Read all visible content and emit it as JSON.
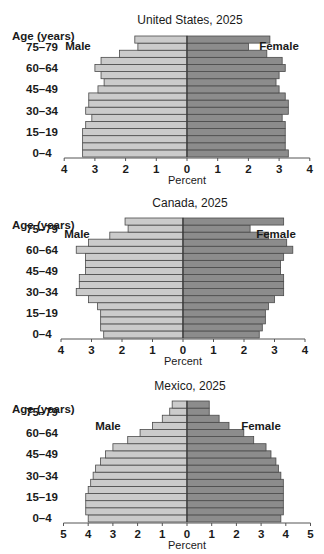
{
  "age_groups": [
    "0-4",
    "5-9",
    "10-14",
    "15-19",
    "20-24",
    "25-29",
    "30-34",
    "35-39",
    "40-44",
    "45-49",
    "50-54",
    "55-59",
    "60-64",
    "65-69",
    "70-74",
    "75-79",
    "80+"
  ],
  "age_labels_shown": [
    "0–4",
    "15–19",
    "30–34",
    "45–49",
    "60–64",
    "75–79"
  ],
  "axis_label_age": "Age (years)",
  "axis_label_x": "Percent",
  "legend": {
    "male": "Male",
    "female": "Female"
  },
  "colors": {
    "male": "#cbcbcb",
    "female": "#8c8c8c",
    "divider": "#4a4a4a",
    "axis": "#555555"
  },
  "chart_data": [
    {
      "type": "bar",
      "orientation": "horizontal-population-pyramid",
      "title": "United States, 2025",
      "xlabel": "Percent",
      "ylabel": "Age (years)",
      "xlim": [
        -4,
        4
      ],
      "xticks": [
        4,
        3,
        2,
        1,
        0,
        1,
        2,
        3,
        4
      ],
      "categories": [
        "0-4",
        "5-9",
        "10-14",
        "15-19",
        "20-24",
        "25-29",
        "30-34",
        "35-39",
        "40-44",
        "45-49",
        "50-54",
        "55-59",
        "60-64",
        "65-69",
        "70-74",
        "75-79",
        "80+"
      ],
      "series": [
        {
          "name": "Male",
          "values": [
            3.4,
            3.4,
            3.4,
            3.4,
            3.3,
            3.1,
            3.3,
            3.2,
            3.2,
            2.9,
            2.7,
            2.8,
            3.0,
            2.8,
            2.2,
            1.6,
            1.7
          ]
        },
        {
          "name": "Female",
          "values": [
            3.3,
            3.2,
            3.2,
            3.2,
            3.2,
            3.1,
            3.3,
            3.3,
            3.2,
            3.0,
            2.9,
            3.0,
            3.2,
            3.1,
            2.6,
            2.0,
            2.7
          ]
        }
      ],
      "legend_position": "inside-top"
    },
    {
      "type": "bar",
      "orientation": "horizontal-population-pyramid",
      "title": "Canada, 2025",
      "xlabel": "Percent",
      "ylabel": "Age (years)",
      "xlim": [
        -4,
        4
      ],
      "xticks": [
        4,
        3,
        2,
        1,
        0,
        1,
        2,
        3,
        4
      ],
      "categories": [
        "0-4",
        "5-9",
        "10-14",
        "15-19",
        "20-24",
        "25-29",
        "30-34",
        "35-39",
        "40-44",
        "45-49",
        "50-54",
        "55-59",
        "60-64",
        "65-69",
        "70-74",
        "75-79",
        "80+"
      ],
      "series": [
        {
          "name": "Male",
          "values": [
            2.6,
            2.7,
            2.7,
            2.7,
            2.8,
            3.1,
            3.5,
            3.4,
            3.4,
            3.2,
            3.2,
            3.2,
            3.5,
            3.1,
            2.4,
            1.8,
            1.9
          ]
        },
        {
          "name": "Female",
          "values": [
            2.5,
            2.6,
            2.7,
            2.7,
            2.8,
            3.0,
            3.3,
            3.3,
            3.3,
            3.2,
            3.2,
            3.3,
            3.6,
            3.4,
            2.8,
            2.2,
            3.3
          ]
        }
      ],
      "legend_position": "inside-top"
    },
    {
      "type": "bar",
      "orientation": "horizontal-population-pyramid",
      "title": "Mexico, 2025",
      "xlabel": "Percent",
      "ylabel": "Age (years)",
      "xlim": [
        -5,
        5
      ],
      "xticks": [
        5,
        4,
        3,
        2,
        1,
        0,
        1,
        2,
        3,
        4,
        5
      ],
      "categories": [
        "0-4",
        "5-9",
        "10-14",
        "15-19",
        "20-24",
        "25-29",
        "30-34",
        "35-39",
        "40-44",
        "45-49",
        "50-54",
        "55-59",
        "60-64",
        "65-69",
        "70-74",
        "75-79",
        "80+"
      ],
      "series": [
        {
          "name": "Male",
          "values": [
            4.0,
            4.1,
            4.1,
            4.1,
            4.0,
            3.9,
            3.8,
            3.7,
            3.5,
            3.3,
            3.0,
            2.4,
            1.9,
            1.4,
            1.0,
            0.7,
            0.6
          ]
        },
        {
          "name": "Female",
          "values": [
            3.8,
            3.9,
            3.9,
            3.9,
            3.9,
            3.9,
            3.8,
            3.7,
            3.6,
            3.4,
            3.2,
            2.7,
            2.3,
            1.7,
            1.3,
            0.9,
            0.9
          ]
        }
      ],
      "legend_position": "inside-middle"
    }
  ],
  "panels_layout": [
    {
      "top": 0,
      "height": 185,
      "title_y": 24,
      "bars_top": 36,
      "bars_bottom": 157,
      "zero_x": 187,
      "unit_px": 30.7,
      "age_title_y": 36,
      "legend_y": 50,
      "male_x": 78,
      "female_x": 279
    },
    {
      "top": 185,
      "height": 182,
      "title_y": 22,
      "bars_top": 33,
      "bars_bottom": 153,
      "zero_x": 183,
      "unit_px": 30.5,
      "age_title_y": 40,
      "legend_y": 53,
      "male_x": 77,
      "female_x": 276
    },
    {
      "top": 367,
      "height": 187,
      "title_y": 23,
      "bars_top": 34,
      "bars_bottom": 155,
      "zero_x": 187,
      "unit_px": 24.7,
      "age_title_y": 42,
      "legend_y": 63,
      "male_x": 108,
      "female_x": 261
    }
  ]
}
